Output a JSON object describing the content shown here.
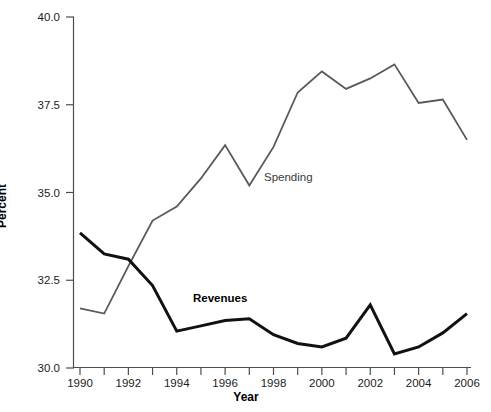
{
  "chart_data": {
    "type": "line",
    "title": "",
    "xlabel": "Year",
    "ylabel": "Percent",
    "xlim": [
      1989.5,
      2006.5
    ],
    "ylim": [
      30.0,
      40.0
    ],
    "grid": false,
    "legend_position": "inline-annotation",
    "x": [
      1990,
      1991,
      1992,
      1993,
      1994,
      1995,
      1996,
      1997,
      1998,
      1999,
      2000,
      2001,
      2002,
      2003,
      2004,
      2005,
      2006
    ],
    "x_tick_labels": [
      "1990",
      "",
      "1992",
      "",
      "1994",
      "",
      "1996",
      "",
      "1998",
      "",
      "2000",
      "",
      "2002",
      "",
      "2004",
      "",
      "2006"
    ],
    "x_ticks_all": [
      1990,
      1991,
      1992,
      1993,
      1994,
      1995,
      1996,
      1997,
      1998,
      1999,
      2000,
      2001,
      2002,
      2003,
      2004,
      2005,
      2006
    ],
    "y_ticks": [
      30.0,
      32.5,
      35.0,
      37.5,
      40.0
    ],
    "y_tick_labels": [
      "30.0",
      "32.5",
      "35.0",
      "37.5",
      "40.0"
    ],
    "series": [
      {
        "name": "Spending",
        "color": "#595959",
        "width": 1.8,
        "values": [
          31.7,
          31.55,
          32.9,
          34.2,
          34.6,
          35.4,
          36.35,
          35.2,
          36.3,
          37.85,
          38.45,
          37.95,
          38.25,
          38.65,
          37.55,
          37.65,
          36.5
        ]
      },
      {
        "name": "Revenues",
        "color": "#111111",
        "width": 3.0,
        "values": [
          33.85,
          33.25,
          33.1,
          32.35,
          31.05,
          31.2,
          31.35,
          31.4,
          30.95,
          30.7,
          30.6,
          30.85,
          31.8,
          30.4,
          30.6,
          31.0,
          31.55
        ]
      }
    ],
    "annotations": [
      {
        "text": "Spending",
        "x": 2000.0,
        "y": 35.3
      },
      {
        "text": "Revenues",
        "x": 1996.6,
        "y": 32.1
      }
    ]
  },
  "axes": {
    "y_title": "Percent",
    "x_title": "Year"
  }
}
